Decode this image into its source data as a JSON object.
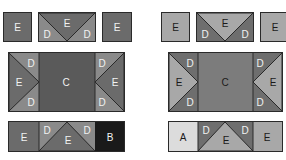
{
  "colors": {
    "left_E": "#6b6b6b",
    "left_D": "#8a8a8a",
    "left_C": "#5a5a5a",
    "left_B": "#1a1a1a",
    "left_text": "#f2f2f2",
    "right_E": "#a8a8a8",
    "right_D": "#6e6e6e",
    "right_C": "#7c7c7c",
    "right_A": "#dcdcdc",
    "right_text_dark": "#1a1a1a",
    "right_text_light": "#f2f2f2",
    "border": "#2a2a2a"
  },
  "left": {
    "top": {
      "tile1": "E",
      "banner": {
        "left": "D",
        "center": "E",
        "right": "D"
      },
      "tile2": "E"
    },
    "middle": {
      "left": {
        "top": "D",
        "mid": "E",
        "bottom": "D"
      },
      "center": "C",
      "right": {
        "top": "D",
        "mid": "E",
        "bottom": "D"
      }
    },
    "bottom": {
      "first": "E",
      "banner": {
        "left": "D",
        "center": "E",
        "right": "D"
      },
      "last": "B"
    }
  },
  "right": {
    "top": {
      "tile1": "E",
      "banner": {
        "left": "D",
        "center": "E",
        "right": "D"
      },
      "tile2": "E"
    },
    "middle": {
      "left": {
        "top": "D",
        "mid": "E",
        "bottom": "D"
      },
      "center": "C",
      "right": {
        "top": "D",
        "mid": "E",
        "bottom": "D"
      }
    },
    "bottom": {
      "first": "A",
      "banner": {
        "left": "D",
        "center": "E",
        "right": "D"
      },
      "last": "E"
    }
  }
}
